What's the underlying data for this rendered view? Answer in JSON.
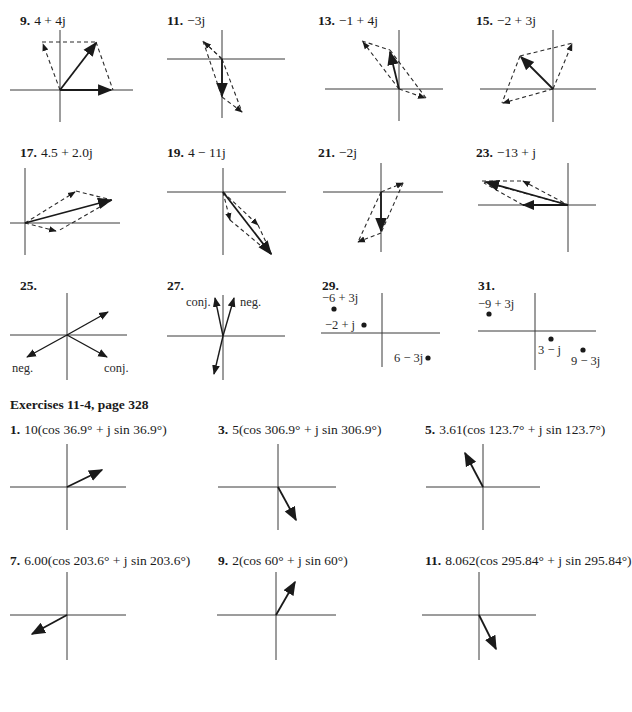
{
  "page": {
    "colors": {
      "ink": "#1a1a1a",
      "axis": "#3a3a3a",
      "background": "#ffffff"
    }
  },
  "section1": {
    "problems": [
      {
        "num": "9.",
        "answer": "4 + 4j",
        "x": 20,
        "y": 14
      },
      {
        "num": "11.",
        "answer": "−3j",
        "x": 167,
        "y": 14
      },
      {
        "num": "13.",
        "answer": "−1 + 4j",
        "x": 318,
        "y": 14
      },
      {
        "num": "15.",
        "answer": "−2 + 3j",
        "x": 476,
        "y": 14
      },
      {
        "num": "17.",
        "answer": "4.5 + 2.0j",
        "x": 20,
        "y": 146
      },
      {
        "num": "19.",
        "answer": "4 − 11j",
        "x": 167,
        "y": 146
      },
      {
        "num": "21.",
        "answer": "−2j",
        "x": 318,
        "y": 146
      },
      {
        "num": "23.",
        "answer": "−13 + j",
        "x": 476,
        "y": 146
      },
      {
        "num": "25.",
        "answer": "",
        "x": 20,
        "y": 279
      },
      {
        "num": "27.",
        "answer": "",
        "x": 167,
        "y": 279
      },
      {
        "num": "29.",
        "answer": "",
        "x": 322,
        "y": 279
      },
      {
        "num": "31.",
        "answer": "",
        "x": 478,
        "y": 279
      }
    ],
    "fig25_labels": {
      "neg": "neg.",
      "conj": "conj."
    },
    "fig27_labels": {
      "neg": "neg.",
      "conj": "conj."
    },
    "fig29_points": [
      "−6 + 3j",
      "−2 + j",
      "6 − 3j"
    ],
    "fig31_points": [
      "−9 + 3j",
      "3 − j",
      "9 − 3j"
    ]
  },
  "section2": {
    "heading": "Exercises 11-4, page 328",
    "problems": [
      {
        "num": "1.",
        "answer": "10(cos 36.9° + j sin 36.9°)",
        "x": 10,
        "y": 423
      },
      {
        "num": "3.",
        "answer": "5(cos 306.9° + j sin 306.9°)",
        "x": 218,
        "y": 423
      },
      {
        "num": "5.",
        "answer": "3.61(cos 123.7° + j sin 123.7°)",
        "x": 425,
        "y": 423
      },
      {
        "num": "7.",
        "answer": "6.00(cos 203.6° + j sin 203.6°)",
        "x": 10,
        "y": 554
      },
      {
        "num": "9.",
        "answer": "2(cos 60° + j sin 60°)",
        "x": 218,
        "y": 554
      },
      {
        "num": "11.",
        "answer": "8.062(cos 295.84° + j sin 295.84°)",
        "x": 425,
        "y": 554
      }
    ]
  }
}
